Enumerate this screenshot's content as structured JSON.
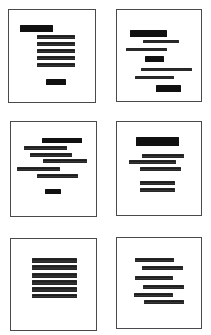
{
  "figure": {
    "colors": {
      "background": "#ffffff",
      "frame": "#4a4a4a",
      "ink": "#1c1c1c"
    },
    "panels": [
      {
        "id": "panel-1",
        "layout": "heading-left-with-right-aligned-block",
        "box": {
          "left": 8,
          "top": 9,
          "width": 88,
          "height": 94
        },
        "bars": [
          {
            "x": 11,
            "y": 15,
            "w": 33,
            "h": 7,
            "weight": "heavy"
          },
          {
            "x": 28,
            "y": 25,
            "w": 38,
            "h": 4,
            "weight": "text"
          },
          {
            "x": 28,
            "y": 32,
            "w": 38,
            "h": 4,
            "weight": "text"
          },
          {
            "x": 28,
            "y": 39,
            "w": 38,
            "h": 4,
            "weight": "text"
          },
          {
            "x": 28,
            "y": 46,
            "w": 38,
            "h": 4,
            "weight": "text"
          },
          {
            "x": 28,
            "y": 53,
            "w": 38,
            "h": 4,
            "weight": "text"
          },
          {
            "x": 37,
            "y": 69,
            "w": 20,
            "h": 6,
            "weight": "heavy"
          }
        ]
      },
      {
        "id": "panel-2",
        "layout": "staggered-asymmetric",
        "box": {
          "left": 116,
          "top": 9,
          "width": 86,
          "height": 93
        },
        "bars": [
          {
            "x": 13,
            "y": 20,
            "w": 37,
            "h": 7,
            "weight": "heavy"
          },
          {
            "x": 26,
            "y": 30,
            "w": 36,
            "h": 3,
            "weight": "text"
          },
          {
            "x": 9,
            "y": 38,
            "w": 41,
            "h": 3,
            "weight": "text"
          },
          {
            "x": 28,
            "y": 46,
            "w": 19,
            "h": 6,
            "weight": "heavy"
          },
          {
            "x": 24,
            "y": 58,
            "w": 51,
            "h": 3,
            "weight": "text"
          },
          {
            "x": 18,
            "y": 66,
            "w": 39,
            "h": 3,
            "weight": "text"
          },
          {
            "x": 39,
            "y": 75,
            "w": 25,
            "h": 7,
            "weight": "heavy"
          }
        ]
      },
      {
        "id": "panel-3",
        "layout": "free-staggered-lines",
        "box": {
          "left": 10,
          "top": 121,
          "width": 87,
          "height": 96
        },
        "bars": [
          {
            "x": 31,
            "y": 16,
            "w": 40,
            "h": 5,
            "weight": "heavy"
          },
          {
            "x": 13,
            "y": 24,
            "w": 43,
            "h": 4,
            "weight": "text"
          },
          {
            "x": 19,
            "y": 31,
            "w": 42,
            "h": 4,
            "weight": "text"
          },
          {
            "x": 32,
            "y": 37,
            "w": 44,
            "h": 4,
            "weight": "text"
          },
          {
            "x": 6,
            "y": 45,
            "w": 43,
            "h": 4,
            "weight": "text"
          },
          {
            "x": 26,
            "y": 52,
            "w": 41,
            "h": 4,
            "weight": "text"
          },
          {
            "x": 34,
            "y": 67,
            "w": 16,
            "h": 5,
            "weight": "heavy"
          }
        ]
      },
      {
        "id": "panel-4",
        "layout": "centered-heading-with-grouped-lines",
        "box": {
          "left": 116,
          "top": 121,
          "width": 86,
          "height": 95
        },
        "bars": [
          {
            "x": 19,
            "y": 15,
            "w": 43,
            "h": 9,
            "weight": "heavy"
          },
          {
            "x": 25,
            "y": 32,
            "w": 42,
            "h": 4,
            "weight": "text"
          },
          {
            "x": 12,
            "y": 38,
            "w": 47,
            "h": 4,
            "weight": "text"
          },
          {
            "x": 23,
            "y": 45,
            "w": 41,
            "h": 4,
            "weight": "text"
          },
          {
            "x": 23,
            "y": 59,
            "w": 35,
            "h": 4,
            "weight": "text"
          },
          {
            "x": 23,
            "y": 66,
            "w": 35,
            "h": 4,
            "weight": "text"
          }
        ]
      },
      {
        "id": "panel-5",
        "layout": "justified-block",
        "box": {
          "left": 10,
          "top": 238,
          "width": 87,
          "height": 93
        },
        "bars": [
          {
            "x": 21,
            "y": 19,
            "w": 45,
            "h": 5,
            "weight": "text"
          },
          {
            "x": 21,
            "y": 26,
            "w": 45,
            "h": 5,
            "weight": "text"
          },
          {
            "x": 21,
            "y": 34,
            "w": 45,
            "h": 5,
            "weight": "text"
          },
          {
            "x": 21,
            "y": 41,
            "w": 45,
            "h": 5,
            "weight": "text"
          },
          {
            "x": 21,
            "y": 48,
            "w": 45,
            "h": 5,
            "weight": "text"
          },
          {
            "x": 21,
            "y": 55,
            "w": 45,
            "h": 4,
            "weight": "text"
          }
        ]
      },
      {
        "id": "panel-6",
        "layout": "alternating-indent",
        "box": {
          "left": 116,
          "top": 237,
          "width": 86,
          "height": 92
        },
        "bars": [
          {
            "x": 18,
            "y": 20,
            "w": 39,
            "h": 4,
            "weight": "text"
          },
          {
            "x": 25,
            "y": 28,
            "w": 41,
            "h": 4,
            "weight": "text"
          },
          {
            "x": 18,
            "y": 38,
            "w": 38,
            "h": 4,
            "weight": "text"
          },
          {
            "x": 26,
            "y": 47,
            "w": 41,
            "h": 4,
            "weight": "text"
          },
          {
            "x": 17,
            "y": 55,
            "w": 39,
            "h": 4,
            "weight": "text"
          },
          {
            "x": 27,
            "y": 62,
            "w": 40,
            "h": 4,
            "weight": "text"
          }
        ]
      }
    ]
  }
}
